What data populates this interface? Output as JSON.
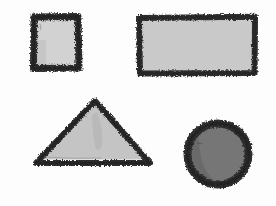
{
  "canvas": {
    "width": 276,
    "height": 206,
    "background_color": "#fdfdfd",
    "title": "Hand-drawn geometric shapes",
    "medium": "charcoal-pencil-sketch",
    "shape_count": 4
  },
  "palette": {
    "paper": "#fdfdfd",
    "stroke_dark": "#2e2e2e",
    "stroke_mid": "#4a4a4a",
    "fill_light": "#d2d2d2",
    "fill_light_alt": "#c9c9c9",
    "fill_triangle": "#c4c4c4",
    "fill_circle": "#767676",
    "fill_circle_shadow": "#6a6a6a",
    "smudge": "#b4b4b4"
  },
  "shapes": [
    {
      "id": "square",
      "name": "Square",
      "label": "square",
      "position": "top-left",
      "fill": "#d2d2d2",
      "stroke": "#2e2e2e",
      "stroke_width": 7,
      "bounds": {
        "x": 30,
        "y": 13,
        "width": 52,
        "height": 59
      }
    },
    {
      "id": "rectangle",
      "name": "Rectangle",
      "label": "rectangle",
      "position": "top-right",
      "fill": "#c9c9c9",
      "stroke": "#2e2e2e",
      "stroke_width": 6,
      "bounds": {
        "x": 136,
        "y": 14,
        "width": 122,
        "height": 62
      }
    },
    {
      "id": "triangle",
      "name": "Triangle",
      "label": "triangle",
      "position": "bottom-left",
      "fill": "#c4c4c4",
      "stroke": "#2e2e2e",
      "stroke_width": 6,
      "bounds": {
        "x": 36,
        "y": 101,
        "width": 114,
        "height": 62
      },
      "vertices": [
        [
          95,
          101
        ],
        [
          150,
          163
        ],
        [
          36,
          163
        ]
      ]
    },
    {
      "id": "circle",
      "name": "Circle",
      "label": "circle",
      "position": "bottom-right",
      "fill": "#767676",
      "stroke": "#2e2e2e",
      "stroke_width": 8,
      "bounds": {
        "x": 184,
        "y": 118,
        "width": 68,
        "height": 72
      },
      "center": [
        218,
        154
      ],
      "radius": 32
    }
  ]
}
